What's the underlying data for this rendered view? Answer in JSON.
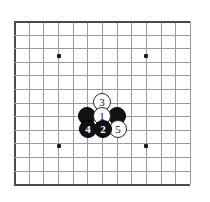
{
  "diagram": {
    "type": "go-board-diagram",
    "board_size_shown": {
      "columns": 13,
      "rows": 12
    },
    "background_color": "#ffffff",
    "line_color": "#9a9a9a",
    "edge_color": "#4a4a4a",
    "black_stone_color": "#121212",
    "white_stone_color": "#ffffff",
    "geometry": {
      "left": 14,
      "top": 21,
      "right": 190,
      "bottom": 184,
      "spacing_x": 14.67,
      "spacing_y": 13.6
    },
    "star_points": [
      {
        "name": "star-top-left",
        "x": 59,
        "y": 56
      },
      {
        "name": "star-top-right",
        "x": 146,
        "y": 56
      },
      {
        "name": "star-bottom-left",
        "x": 59,
        "y": 146
      },
      {
        "name": "star-bottom-right",
        "x": 146,
        "y": 146
      }
    ],
    "stones": [
      {
        "id": "stone-black-left",
        "color": "black",
        "label": "",
        "x": 87,
        "y": 116,
        "r": 9,
        "layer": 1
      },
      {
        "id": "stone-black-right",
        "color": "black",
        "label": "",
        "x": 117,
        "y": 116,
        "r": 9,
        "layer": 1
      },
      {
        "id": "stone-white-3",
        "color": "white",
        "label": "3",
        "x": 102,
        "y": 102,
        "r": 9,
        "layer": 2
      },
      {
        "id": "stone-white-1",
        "color": "white",
        "label": "1",
        "x": 102,
        "y": 116,
        "r": 9,
        "layer": 2
      },
      {
        "id": "stone-black-4",
        "color": "black",
        "label": "4",
        "x": 88,
        "y": 129,
        "r": 9,
        "layer": 3
      },
      {
        "id": "stone-black-2",
        "color": "black",
        "label": "2",
        "x": 103,
        "y": 129,
        "r": 9,
        "layer": 3
      },
      {
        "id": "stone-white-5",
        "color": "white",
        "label": "5",
        "x": 118,
        "y": 129,
        "r": 9,
        "layer": 2
      }
    ],
    "move_sequence": [
      "1",
      "2",
      "3",
      "4",
      "5"
    ]
  }
}
